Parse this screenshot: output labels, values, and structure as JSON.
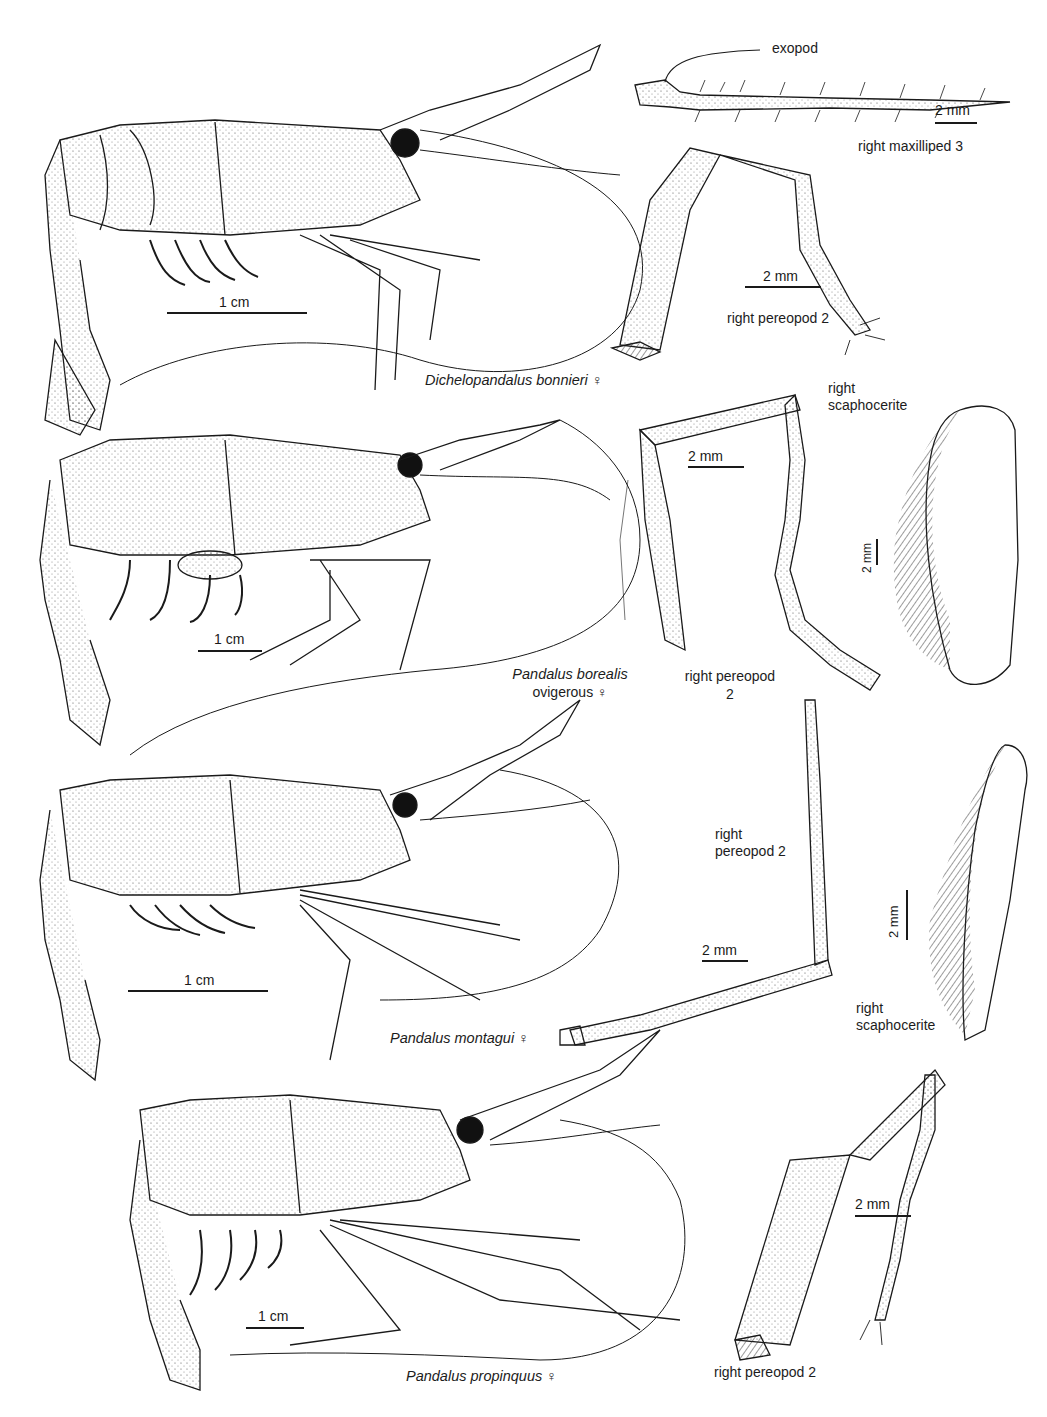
{
  "plate": {
    "figures": [
      {
        "species": "Dichelopandalus bonnieri",
        "sex_symbol": "♀",
        "scale": "1 cm"
      },
      {
        "species": "Pandalus borealis",
        "note": "ovigerous",
        "sex_symbol": "♀",
        "scale": "1 cm"
      },
      {
        "species": "Pandalus montagui",
        "sex_symbol": "♀",
        "scale": "1 cm"
      },
      {
        "species": "Pandalus propinquus",
        "sex_symbol": "♀",
        "scale": "1 cm"
      }
    ],
    "details": {
      "exopod": "exopod",
      "maxilliped": "right maxilliped 3",
      "maxilliped_scale": "2 mm",
      "pereopod_1": "right pereopod 2",
      "pereopod_1_scale": "2 mm",
      "scaphocerite_1_line1": "right",
      "scaphocerite_1_line2": "scaphocerite",
      "scaphocerite_1_scale": "2 mm",
      "pereopod_2_line1": "right pereopod",
      "pereopod_2_line2": "2",
      "pereopod_2_scale": "2 mm",
      "pereopod_3_line1": "right",
      "pereopod_3_line2": "pereopod 2",
      "pereopod_3_scale": "2 mm",
      "scaphocerite_2_line1": "right",
      "scaphocerite_2_line2": "scaphocerite",
      "scaphocerite_2_scale": "2 mm",
      "pereopod_4": "right pereopod 2",
      "pereopod_4_scale": "2 mm"
    }
  }
}
